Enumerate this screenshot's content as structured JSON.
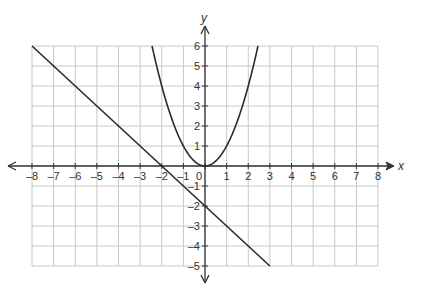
{
  "chart_data": {
    "type": "line",
    "title": "",
    "xlabel": "x",
    "ylabel": "y",
    "xlim": [
      -8,
      8
    ],
    "ylim": [
      -5,
      6
    ],
    "grid": true,
    "x_ticks": [
      -8,
      -7,
      -6,
      -5,
      -4,
      -3,
      -2,
      -1,
      0,
      1,
      2,
      3,
      4,
      5,
      6,
      7,
      8
    ],
    "y_ticks": [
      -5,
      -4,
      -3,
      -2,
      -1,
      1,
      2,
      3,
      4,
      5,
      6
    ],
    "series": [
      {
        "name": "line",
        "equation": "y = -x - 2",
        "x": [
          -8,
          -7,
          -6,
          -5,
          -4,
          -3,
          -2,
          -1,
          0,
          1,
          2,
          3
        ],
        "y": [
          6,
          5,
          4,
          3,
          2,
          1,
          0,
          -1,
          -2,
          -3,
          -4,
          -5
        ]
      },
      {
        "name": "parabola",
        "equation": "y = x^2",
        "x": [
          -2.45,
          -2,
          -1.5,
          -1,
          -0.5,
          0,
          0.5,
          1,
          1.5,
          2,
          2.45
        ],
        "y": [
          6,
          4,
          2.25,
          1,
          0.25,
          0,
          0.25,
          1,
          2.25,
          4,
          6
        ]
      }
    ],
    "colors": {
      "grid": "#c8c8c8",
      "axis": "#333333",
      "curve": "#2a2a2a"
    }
  }
}
